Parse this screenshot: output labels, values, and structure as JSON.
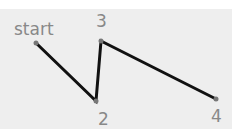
{
  "diagram": {
    "background": "#eeeeee",
    "line_color": "#111111",
    "label_color": "#888888",
    "points": [
      {
        "label": "start",
        "x": 36,
        "y": 43
      },
      {
        "label": "2",
        "x": 96,
        "y": 101
      },
      {
        "label": "3",
        "x": 101,
        "y": 41
      },
      {
        "label": "4",
        "x": 216,
        "y": 99
      }
    ]
  }
}
